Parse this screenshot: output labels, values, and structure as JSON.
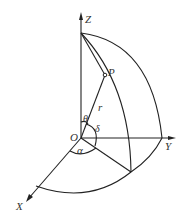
{
  "diagram": {
    "labels": {
      "z_axis": "Z",
      "y_axis": "Y",
      "x_axis": "X",
      "origin": "O",
      "point": "P",
      "radius": "r",
      "theta": "θ",
      "delta": "δ",
      "alpha": "α"
    },
    "colors": {
      "stroke": "#222222",
      "text": "#333333",
      "background": "#ffffff"
    }
  }
}
